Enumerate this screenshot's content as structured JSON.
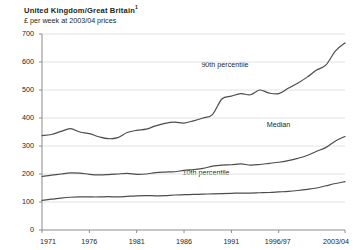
{
  "header": {
    "title": "United Kingdom/Great Britain",
    "title_footnote": "1",
    "subtitle": "£ per week at 2003/04 prices"
  },
  "chart_data": {
    "type": "line",
    "title": "United Kingdom/Great Britain",
    "subtitle": "£ per week at 2003/04 prices",
    "xlabel": "",
    "ylabel": "£ per week at 2003/04 prices",
    "ylim": [
      0,
      700
    ],
    "yticks": [
      0,
      100,
      200,
      300,
      400,
      500,
      600,
      700
    ],
    "xticks": [
      "1971",
      "1976",
      "1981",
      "1986",
      "1991",
      "1996/97",
      "2003/04"
    ],
    "xtick_positions": [
      1971,
      1976,
      1981,
      1986,
      1991,
      1996,
      2003
    ],
    "xlim": [
      1971,
      2003
    ],
    "grid": "horizontal",
    "legend": "inline-labels",
    "x": [
      1971,
      1972,
      1973,
      1974,
      1975,
      1976,
      1977,
      1978,
      1979,
      1980,
      1981,
      1982,
      1983,
      1984,
      1985,
      1986,
      1987,
      1988,
      1989,
      1990,
      1991,
      1992,
      1993,
      1994,
      1995,
      1996,
      1997,
      1998,
      1999,
      2000,
      2001,
      2002,
      2003
    ],
    "series": [
      {
        "name": "90th percentile",
        "label": "90th percentile",
        "color": "#4d4d4d",
        "values": [
          337,
          341,
          352,
          362,
          350,
          344,
          333,
          326,
          330,
          348,
          356,
          360,
          372,
          381,
          385,
          382,
          390,
          400,
          412,
          468,
          478,
          487,
          483,
          500,
          489,
          487,
          506,
          524,
          546,
          571,
          590,
          640,
          668
        ]
      },
      {
        "name": "Median",
        "label": "Median",
        "color": "#4d4d4d",
        "values": [
          191,
          196,
          200,
          204,
          203,
          199,
          197,
          198,
          200,
          202,
          199,
          200,
          205,
          207,
          208,
          213,
          216,
          220,
          228,
          232,
          233,
          236,
          232,
          234,
          238,
          242,
          248,
          256,
          266,
          281,
          295,
          318,
          334
        ]
      },
      {
        "name": "10th percentile",
        "label": "10th percentile",
        "color": "#4d4d4d",
        "values": [
          106,
          110,
          114,
          117,
          118,
          118,
          118,
          119,
          118,
          120,
          122,
          123,
          122,
          123,
          125,
          126,
          127,
          128,
          129,
          130,
          131,
          132,
          132,
          133,
          134,
          136,
          138,
          141,
          145,
          150,
          158,
          166,
          173
        ]
      }
    ],
    "annotations": [
      {
        "text": "90th percentile",
        "x": 1991,
        "y": 590
      },
      {
        "text": "Median",
        "x": 1996,
        "y": 375
      },
      {
        "text": "10th percentile",
        "x": 1989,
        "y": 205
      }
    ]
  }
}
